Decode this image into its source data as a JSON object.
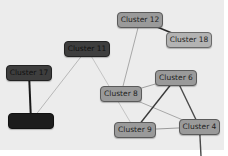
{
  "graph": {
    "background": "#ececec",
    "nodes": [
      {
        "id": "c11",
        "label": "Cluster 11",
        "x": 64,
        "y": 41,
        "w": 46,
        "style": "dark",
        "fill": "#3e3e3e"
      },
      {
        "id": "c17",
        "label": "Cluster 17",
        "x": 6,
        "y": 65,
        "w": 46,
        "style": "dark",
        "fill": "#3e3e3e"
      },
      {
        "id": "c12",
        "label": "Cluster 12",
        "x": 117,
        "y": 12,
        "w": 46,
        "style": "gray",
        "fill": "#9a9a9a"
      },
      {
        "id": "c18",
        "label": "Cluster 18",
        "x": 166,
        "y": 32,
        "w": 46,
        "style": "light",
        "fill": "#b3b3b3"
      },
      {
        "id": "c6",
        "label": "Cluster 6",
        "x": 155,
        "y": 70,
        "w": 42,
        "style": "gray",
        "fill": "#9a9a9a"
      },
      {
        "id": "c8",
        "label": "Cluster 8",
        "x": 100,
        "y": 86,
        "w": 42,
        "style": "gray",
        "fill": "#9a9a9a"
      },
      {
        "id": "c9",
        "label": "Cluster 9",
        "x": 114,
        "y": 122,
        "w": 42,
        "style": "gray",
        "fill": "#9a9a9a"
      },
      {
        "id": "c4",
        "label": "Cluster 4",
        "x": 179,
        "y": 119,
        "w": 41,
        "style": "gray",
        "fill": "#9a9a9a"
      },
      {
        "id": "c_unlabeled",
        "label": "",
        "x": 8,
        "y": 113,
        "w": 46,
        "style": "black",
        "fill": "#1c1c1c"
      }
    ],
    "edges": [
      {
        "from": "c12",
        "to": "c18",
        "color": "#2a2a2a",
        "width": 1.6
      },
      {
        "from": "c12",
        "to": "c8",
        "color": "#a8a8a8",
        "width": 1
      },
      {
        "from": "c11",
        "to": "c_unlabeled",
        "color": "#b8b8b8",
        "width": 1
      },
      {
        "from": "c11",
        "to": "c9",
        "color": "#c4c4c4",
        "width": 1
      },
      {
        "from": "c17",
        "to": "c_unlabeled",
        "color": "#1a1a1a",
        "width": 2
      },
      {
        "from": "c8",
        "to": "c6",
        "color": "#a0a0a0",
        "width": 1
      },
      {
        "from": "c8",
        "to": "c4",
        "color": "#a8a8a8",
        "width": 1
      },
      {
        "from": "c6",
        "to": "c9",
        "color": "#3a3a3a",
        "width": 1.4
      },
      {
        "from": "c6",
        "to": "c4",
        "color": "#4a4a4a",
        "width": 1.4
      },
      {
        "from": "c9",
        "to": "c4",
        "color": "#9a9a9a",
        "width": 1
      },
      {
        "from": "c4",
        "to": "offscreen",
        "color": "#4a4a4a",
        "width": 1.4,
        "end": [
          201,
          156
        ]
      }
    ]
  }
}
